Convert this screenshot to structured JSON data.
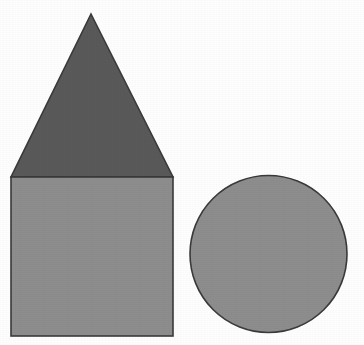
{
  "figure": {
    "title": "Geometric shapes: house outline and circle",
    "background_color": "#fdfdfd",
    "width": 364,
    "height": 345,
    "outline_color": "#3a3a3a",
    "outline_width": 1.6,
    "shapes": [
      {
        "id": "triangle",
        "name": "triangle-roof",
        "label": "Triangle",
        "fill": "#595959",
        "points": "91,14 173,177 11,177",
        "apex": {
          "x": 91,
          "y": 14
        },
        "base_left": {
          "x": 11,
          "y": 177
        },
        "base_right": {
          "x": 173,
          "y": 177
        },
        "base_width": 162,
        "height": 163
      },
      {
        "id": "square",
        "name": "square-body",
        "label": "Square",
        "fill": "#8d8d8d",
        "x": 11,
        "y": 177,
        "width": 162,
        "height": 159
      },
      {
        "id": "circle",
        "name": "circle",
        "label": "Circle",
        "fill": "#8d8d8d",
        "cx": 268.5,
        "cy": 254,
        "r": 78.5,
        "diameter": 157
      }
    ]
  }
}
